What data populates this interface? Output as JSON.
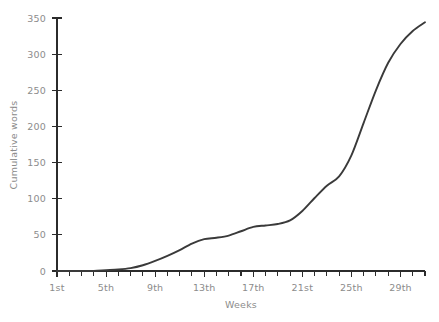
{
  "chart_data": {
    "type": "line",
    "title": "",
    "xlabel": "Weeks",
    "ylabel": "Cumulative words",
    "xlim": [
      1,
      31
    ],
    "ylim": [
      0,
      350
    ],
    "grid": false,
    "legend": false,
    "line_color": "#3a3a3a",
    "axis_color": "#2b2b2b",
    "text_color": "#8c8c8c",
    "background_color": "#ffffff",
    "y_ticks": [
      0,
      50,
      100,
      150,
      200,
      250,
      300,
      350
    ],
    "y_tick_labels": [
      "0",
      "50",
      "100",
      "150",
      "200",
      "250",
      "300",
      "350"
    ],
    "x_ticks_major": [
      1,
      5,
      9,
      13,
      17,
      21,
      25,
      29
    ],
    "x_tick_labels": [
      "1st",
      "5th",
      "9th",
      "13th",
      "17th",
      "21st",
      "25th",
      "29th"
    ],
    "x_ticks_minor": [
      2,
      3,
      4,
      6,
      7,
      8,
      10,
      11,
      12,
      14,
      15,
      16,
      18,
      19,
      20,
      22,
      23,
      24,
      26,
      27,
      28,
      30,
      31
    ],
    "x": [
      1,
      2,
      3,
      4,
      5,
      6,
      7,
      8,
      9,
      10,
      11,
      12,
      13,
      14,
      15,
      16,
      17,
      18,
      19,
      20,
      21,
      22,
      23,
      24,
      25,
      26,
      27,
      28,
      29,
      30,
      31
    ],
    "values": [
      0,
      0,
      0,
      0,
      1,
      2,
      4,
      8,
      14,
      21,
      29,
      38,
      44,
      46,
      49,
      55,
      61,
      63,
      65,
      70,
      83,
      101,
      118,
      131,
      160,
      205,
      250,
      288,
      314,
      332,
      344
    ],
    "series": [
      {
        "name": "Cumulative words",
        "values": [
          0,
          0,
          0,
          0,
          1,
          2,
          4,
          8,
          14,
          21,
          29,
          38,
          44,
          46,
          49,
          55,
          61,
          63,
          65,
          70,
          83,
          101,
          118,
          131,
          160,
          205,
          250,
          288,
          314,
          332,
          344
        ]
      }
    ],
    "annotations": []
  },
  "layout": {
    "plot_left": 57,
    "plot_right": 425,
    "plot_top": 18,
    "plot_bottom": 271
  }
}
